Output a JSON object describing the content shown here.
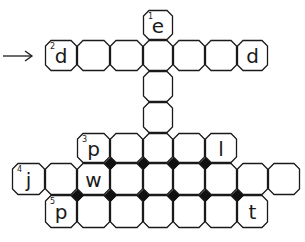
{
  "puzzle": {
    "type": "crossword",
    "colors": {
      "line": "#1a1a1a",
      "background": "#ffffff",
      "junction": "#111111"
    },
    "arrow": {
      "icon": "right-arrow-icon",
      "points_to_clue": 2
    },
    "grid": {
      "col_edges": [
        12,
        45,
        77,
        110,
        143,
        173,
        205,
        237,
        268,
        300
      ],
      "row_edges": [
        10,
        40,
        71,
        102,
        133,
        163,
        195,
        228
      ]
    },
    "cells": [
      {
        "row": 0,
        "col": 4,
        "letter": "e",
        "number": "1"
      },
      {
        "row": 1,
        "col": 1,
        "letter": "d",
        "number": "2"
      },
      {
        "row": 1,
        "col": 2,
        "letter": "",
        "number": ""
      },
      {
        "row": 1,
        "col": 3,
        "letter": "",
        "number": ""
      },
      {
        "row": 1,
        "col": 4,
        "letter": "",
        "number": ""
      },
      {
        "row": 1,
        "col": 5,
        "letter": "",
        "number": ""
      },
      {
        "row": 1,
        "col": 6,
        "letter": "",
        "number": ""
      },
      {
        "row": 1,
        "col": 7,
        "letter": "d",
        "number": ""
      },
      {
        "row": 2,
        "col": 4,
        "letter": "",
        "number": ""
      },
      {
        "row": 3,
        "col": 4,
        "letter": "",
        "number": ""
      },
      {
        "row": 4,
        "col": 2,
        "letter": "p",
        "number": "3"
      },
      {
        "row": 4,
        "col": 3,
        "letter": "",
        "number": ""
      },
      {
        "row": 4,
        "col": 4,
        "letter": "",
        "number": ""
      },
      {
        "row": 4,
        "col": 5,
        "letter": "",
        "number": ""
      },
      {
        "row": 4,
        "col": 6,
        "letter": "l",
        "number": ""
      },
      {
        "row": 5,
        "col": 0,
        "letter": "j",
        "number": "4"
      },
      {
        "row": 5,
        "col": 1,
        "letter": "",
        "number": ""
      },
      {
        "row": 5,
        "col": 2,
        "letter": "w",
        "number": ""
      },
      {
        "row": 5,
        "col": 3,
        "letter": "",
        "number": ""
      },
      {
        "row": 5,
        "col": 4,
        "letter": "",
        "number": ""
      },
      {
        "row": 5,
        "col": 5,
        "letter": "",
        "number": ""
      },
      {
        "row": 5,
        "col": 6,
        "letter": "",
        "number": ""
      },
      {
        "row": 5,
        "col": 7,
        "letter": "",
        "number": ""
      },
      {
        "row": 5,
        "col": 8,
        "letter": "",
        "number": ""
      },
      {
        "row": 6,
        "col": 1,
        "letter": "p",
        "number": "5"
      },
      {
        "row": 6,
        "col": 2,
        "letter": "",
        "number": ""
      },
      {
        "row": 6,
        "col": 3,
        "letter": "",
        "number": ""
      },
      {
        "row": 6,
        "col": 4,
        "letter": "",
        "number": ""
      },
      {
        "row": 6,
        "col": 5,
        "letter": "",
        "number": ""
      },
      {
        "row": 6,
        "col": 6,
        "letter": "",
        "number": ""
      },
      {
        "row": 6,
        "col": 7,
        "letter": "t",
        "number": ""
      }
    ],
    "junctions": [
      {
        "x": 110,
        "y": 163
      },
      {
        "x": 143,
        "y": 163
      },
      {
        "x": 173,
        "y": 163
      },
      {
        "x": 205,
        "y": 163
      },
      {
        "x": 77,
        "y": 195
      },
      {
        "x": 110,
        "y": 195
      },
      {
        "x": 143,
        "y": 195
      },
      {
        "x": 173,
        "y": 195
      },
      {
        "x": 205,
        "y": 195
      },
      {
        "x": 237,
        "y": 195
      }
    ]
  }
}
